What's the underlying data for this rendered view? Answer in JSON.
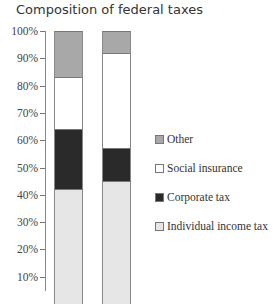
{
  "title": "Composition of federal taxes",
  "axis": {
    "ticks": [
      "100%",
      "90%",
      "80%",
      "70%",
      "60%",
      "50%",
      "40%",
      "30%",
      "20%",
      "10%"
    ]
  },
  "legend": [
    {
      "label": "Other",
      "color": "#a8a8a8"
    },
    {
      "label": "Social insurance",
      "color": "#ffffff"
    },
    {
      "label": "Corporate tax",
      "color": "#2a2a2a"
    },
    {
      "label": "Individual income tax",
      "color": "#e6e6e6"
    }
  ],
  "chart_data": {
    "type": "bar",
    "stacked": true,
    "title": "Composition of federal taxes",
    "xlabel": "",
    "ylabel": "",
    "categories": [
      "Bar 1",
      "Bar 2"
    ],
    "series": [
      {
        "name": "Individual income tax",
        "values": [
          42,
          45
        ],
        "color": "#e6e6e6"
      },
      {
        "name": "Corporate tax",
        "values": [
          22,
          12
        ],
        "color": "#2a2a2a"
      },
      {
        "name": "Social insurance",
        "values": [
          19,
          35
        ],
        "color": "#ffffff"
      },
      {
        "name": "Other",
        "values": [
          17,
          8
        ],
        "color": "#a8a8a8"
      }
    ],
    "ylim": [
      0,
      100
    ],
    "yticks": [
      "10%",
      "20%",
      "30%",
      "40%",
      "50%",
      "60%",
      "70%",
      "80%",
      "90%",
      "100%"
    ],
    "legend_position": "right",
    "grid": false
  }
}
